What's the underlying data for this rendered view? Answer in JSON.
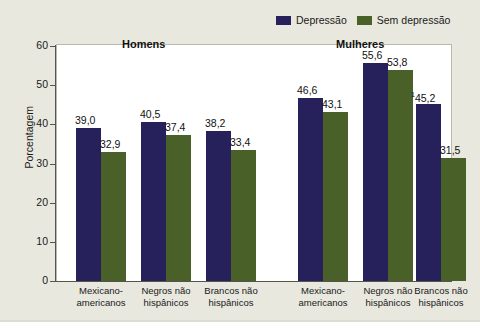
{
  "chart_data": {
    "type": "bar",
    "title": "",
    "xlabel": "",
    "ylabel": "Porcentagem",
    "ylim": [
      0,
      60
    ],
    "yticks": [
      0,
      10,
      20,
      30,
      40,
      50,
      60
    ],
    "ytick_labels": [
      "0",
      "10",
      "20",
      "30",
      "40",
      "50",
      "60"
    ],
    "grid": false,
    "legend_position": "top-right",
    "panel_titles": [
      "Homens",
      "Mulheres"
    ],
    "categories": [
      "Mexicano-americanos",
      "Negros não hispânicos",
      "Brancos não hispânicos",
      "Mexicano-americanos",
      "Negros não hispânicos",
      "Brancos não hispânicos"
    ],
    "series": [
      {
        "name": "Depressão",
        "color": "#26215a",
        "values": [
          39.0,
          40.5,
          38.2,
          46.6,
          55.6,
          45.2
        ],
        "labels": [
          "39,0",
          "40,5",
          "38,2",
          "46,6",
          "55,6",
          "45,2"
        ]
      },
      {
        "name": "Sem depressão",
        "color": "#4a6029",
        "values": [
          32.9,
          37.4,
          33.4,
          43.1,
          53.8,
          31.5
        ],
        "labels": [
          "32,9",
          "37,4",
          "33,4",
          "43,1",
          "53,8",
          "31,5"
        ]
      }
    ],
    "annotations": [
      {
        "target": "Depressão / Brancos não hispânicos (Mulheres)",
        "marker": "1"
      }
    ]
  },
  "legend": {
    "items": [
      {
        "label": "Depressão",
        "swatch": "#26215a"
      },
      {
        "label": "Sem depressão",
        "swatch": "#4a6029"
      }
    ]
  },
  "axis": {
    "y_title": "Porcentagem",
    "y_ticks": [
      "60",
      "50",
      "40",
      "30",
      "20",
      "10",
      "0"
    ]
  },
  "groups": [
    {
      "title": "Homens"
    },
    {
      "title": "Mulheres"
    }
  ],
  "x_categories": [
    {
      "line1": "Mexicano-",
      "line2": "americanos"
    },
    {
      "line1": "Negros não",
      "line2": "hispânicos"
    },
    {
      "line1": "Brancos não",
      "line2": "hispânicos"
    },
    {
      "line1": "Mexicano-",
      "line2": "americanos"
    },
    {
      "line1": "Negros não",
      "line2": "hispânicos"
    },
    {
      "line1": "Brancos não",
      "line2": "hispânicos"
    }
  ],
  "value_labels": {
    "g0_dep": "39,0",
    "g0_sem": "32,9",
    "g1_dep": "40,5",
    "g1_sem": "37,4",
    "g2_dep": "38,2",
    "g2_sem": "33,4",
    "g3_dep": "46,6",
    "g3_sem": "43,1",
    "g4_dep": "55,6",
    "g4_sem": "53,8",
    "g5_dep": "45,2",
    "g5_sem": "31,5",
    "g5_dep_marker": "1"
  },
  "colors": {
    "panel_background": "#e8e8de",
    "plot_background": "#ffffff",
    "depression_bar": "#26215a",
    "no_depression_bar": "#4a6029",
    "axis": "#55554c"
  }
}
